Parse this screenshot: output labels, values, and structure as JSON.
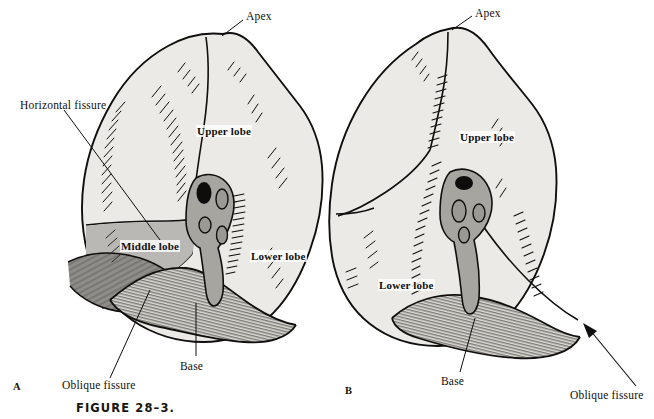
{
  "figure": {
    "caption": "FIGURE 28–3.",
    "background_color": "#ffffff",
    "ink_color": "#100f0d",
    "lobe_fill_light": "#ebeae6",
    "lobe_fill_mid": "#b9b8b4",
    "lobe_fill_dark": "#8e8d89"
  },
  "panels": [
    {
      "letter": "A",
      "name": "right-lung-lateral",
      "labels": {
        "apex": "Apex",
        "horizontal_fissure": "Horizontal fissure",
        "upper_lobe": "Upper lobe",
        "middle_lobe": "Middle lobe",
        "lower_lobe": "Lower lobe",
        "oblique_fissure": "Oblique fissure",
        "base": "Base"
      }
    },
    {
      "letter": "B",
      "name": "left-lung-lateral",
      "labels": {
        "apex": "Apex",
        "upper_lobe": "Upper lobe",
        "lower_lobe": "Lower lobe",
        "oblique_fissure": "Oblique fissure",
        "base": "Base"
      }
    }
  ]
}
